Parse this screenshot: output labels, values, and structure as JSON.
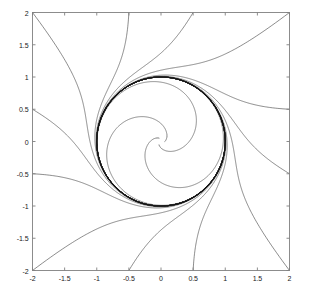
{
  "figure": {
    "width": 311,
    "height": 298,
    "background": "#ffffff",
    "axes_color": "#808080",
    "curve_color": "#3c3c3c",
    "cycle_color": "#101010",
    "tick_label_color": "#1a1a1a"
  },
  "chart_data": {
    "type": "line",
    "title": "",
    "xlabel": "",
    "ylabel": "",
    "xlim": [
      -2,
      2
    ],
    "ylim": [
      -2,
      2
    ],
    "grid": false,
    "legend": "none",
    "xticks": [
      -2,
      -1.5,
      -1,
      -0.5,
      0,
      0.5,
      1,
      1.5,
      2
    ],
    "xtick_labels": [
      "-2",
      "-1.5",
      "-1",
      "-0.5",
      "0",
      "0.5",
      "1",
      "1.5",
      "2"
    ],
    "yticks": [
      -2,
      -1.5,
      -1,
      -0.5,
      0,
      0.5,
      1,
      1.5,
      2
    ],
    "ytick_labels": [
      "-2",
      "-1.5",
      "-1",
      "-0.5",
      "0",
      "0.5",
      "1",
      "1.5",
      "2"
    ],
    "limit_cycle": {
      "shape": "circle",
      "center": [
        0,
        0
      ],
      "radius": 1,
      "stability": "stable"
    },
    "equilibrium": {
      "point": [
        0,
        0
      ],
      "type": "unstable-spiral"
    },
    "series": [
      {
        "name": "inner-spiral-1",
        "r0": 0.06,
        "theta0_deg": 0,
        "direction": "outward"
      },
      {
        "name": "inner-spiral-2",
        "r0": 0.06,
        "theta0_deg": 120,
        "direction": "outward"
      },
      {
        "name": "inner-spiral-3",
        "r0": 0.06,
        "theta0_deg": 240,
        "direction": "outward"
      },
      {
        "name": "outer-spiral-1",
        "start": [
          -2,
          -2
        ],
        "direction": "inward"
      },
      {
        "name": "outer-spiral-2",
        "start": [
          -2,
          -0.5
        ],
        "direction": "inward"
      },
      {
        "name": "outer-spiral-3",
        "start": [
          -2,
          0.5
        ],
        "direction": "inward"
      },
      {
        "name": "outer-spiral-4",
        "start": [
          -2,
          2
        ],
        "direction": "inward"
      },
      {
        "name": "outer-spiral-5",
        "start": [
          -0.5,
          2
        ],
        "direction": "inward"
      },
      {
        "name": "outer-spiral-6",
        "start": [
          0.5,
          2
        ],
        "direction": "inward"
      },
      {
        "name": "outer-spiral-7",
        "start": [
          2,
          2
        ],
        "direction": "inward"
      },
      {
        "name": "outer-spiral-8",
        "start": [
          2,
          0.5
        ],
        "direction": "inward"
      },
      {
        "name": "outer-spiral-9",
        "start": [
          2,
          -0.5
        ],
        "direction": "inward"
      },
      {
        "name": "outer-spiral-10",
        "start": [
          2,
          -2
        ],
        "direction": "inward"
      },
      {
        "name": "outer-spiral-11",
        "start": [
          0.5,
          -2
        ],
        "direction": "inward"
      },
      {
        "name": "outer-spiral-12",
        "start": [
          -0.5,
          -2
        ],
        "direction": "inward"
      }
    ]
  }
}
